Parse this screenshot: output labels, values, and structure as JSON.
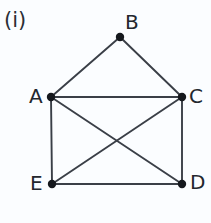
{
  "figure": {
    "caption": "(i)",
    "background_color": "#fbfdff",
    "ink_color": "#3a3f47",
    "label_color": "#23272e",
    "width": 211,
    "height": 223
  },
  "graph": {
    "type": "undirected-graph",
    "vertex_count": 5,
    "edge_count": 8,
    "vertex_radius": 4.2,
    "edge_width": 1.9,
    "vertices": [
      {
        "id": "A",
        "label": "A",
        "x": 51,
        "y": 97,
        "label_x": 29,
        "label_y": 86
      },
      {
        "id": "B",
        "label": "B",
        "x": 120,
        "y": 37,
        "label_x": 125,
        "label_y": 12
      },
      {
        "id": "C",
        "label": "C",
        "x": 182,
        "y": 97,
        "label_x": 189,
        "label_y": 86
      },
      {
        "id": "D",
        "label": "D",
        "x": 182,
        "y": 184,
        "label_x": 190,
        "label_y": 172
      },
      {
        "id": "E",
        "label": "E",
        "x": 52,
        "y": 184,
        "label_x": 30,
        "label_y": 173
      }
    ],
    "edges": [
      {
        "from": "A",
        "to": "B",
        "name": "edge-a-b"
      },
      {
        "from": "B",
        "to": "C",
        "name": "edge-b-c"
      },
      {
        "from": "A",
        "to": "C",
        "name": "edge-a-c"
      },
      {
        "from": "A",
        "to": "E",
        "name": "edge-a-e"
      },
      {
        "from": "C",
        "to": "D",
        "name": "edge-c-d"
      },
      {
        "from": "E",
        "to": "D",
        "name": "edge-e-d"
      },
      {
        "from": "A",
        "to": "D",
        "name": "edge-a-d"
      },
      {
        "from": "C",
        "to": "E",
        "name": "edge-c-e"
      }
    ],
    "crossing_point": {
      "x": 116,
      "y": 143
    }
  }
}
